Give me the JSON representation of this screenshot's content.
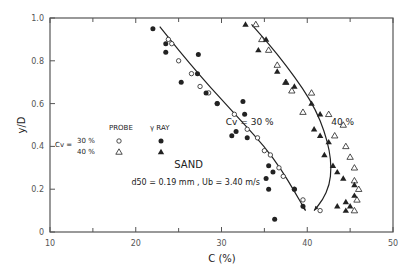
{
  "chart_data": {
    "type": "scatter",
    "title": "",
    "xlabel": "C (%)",
    "ylabel": "y/D",
    "xlim": [
      10,
      50
    ],
    "ylim": [
      0,
      1.0
    ],
    "xticks": [
      10,
      20,
      30,
      40,
      50
    ],
    "xminor": [
      15,
      25,
      35,
      45
    ],
    "yticks": [
      0,
      0.2,
      0.4,
      0.6,
      0.8,
      1.0
    ],
    "ytick_labels": [
      "0",
      "0.2",
      "0.4",
      "0.6",
      "0.8",
      "1.0"
    ],
    "grid": false,
    "legend": {
      "position": "left-middle",
      "header_probe": "PROBE",
      "header_ray": "γ RAY",
      "row_label": "Cv =",
      "rows": [
        {
          "label": "30 %",
          "probe_marker": "open-circle",
          "ray_marker": "filled-circle"
        },
        {
          "label": "40 %",
          "probe_marker": "open-triangle",
          "ray_marker": "filled-triangle"
        }
      ]
    },
    "annotations": [
      {
        "text": "Cv =  30 %",
        "x": 30.5,
        "y": 0.5
      },
      {
        "text": "40 %",
        "x": 42.8,
        "y": 0.5
      },
      {
        "text": "SAND",
        "x": 24.5,
        "y": 0.3
      },
      {
        "text": "d50 = 0.19 mm ,  Ub = 3.40 m/s",
        "x": 19.5,
        "y": 0.22
      }
    ],
    "series": [
      {
        "name": "Cv 30% PROBE",
        "marker": "open-circle",
        "points": [
          [
            23.8,
            0.9
          ],
          [
            24.2,
            0.88
          ],
          [
            25.0,
            0.8
          ],
          [
            26.5,
            0.74
          ],
          [
            27.5,
            0.68
          ],
          [
            28.5,
            0.65
          ],
          [
            29.5,
            0.6
          ],
          [
            31.5,
            0.55
          ],
          [
            33.0,
            0.48
          ],
          [
            34.2,
            0.44
          ],
          [
            35.0,
            0.38
          ],
          [
            35.7,
            0.36
          ],
          [
            36.7,
            0.3
          ],
          [
            37.2,
            0.26
          ],
          [
            38.5,
            0.2
          ],
          [
            39.5,
            0.15
          ],
          [
            41.5,
            0.1
          ]
        ]
      },
      {
        "name": "Cv 30% GAMMA RAY",
        "marker": "filled-circle",
        "points": [
          [
            22.0,
            0.95
          ],
          [
            23.5,
            0.88
          ],
          [
            23.5,
            0.84
          ],
          [
            27.3,
            0.83
          ],
          [
            25.3,
            0.7
          ],
          [
            27.2,
            0.74
          ],
          [
            28.2,
            0.65
          ],
          [
            29.5,
            0.6
          ],
          [
            32.5,
            0.61
          ],
          [
            32.7,
            0.55
          ],
          [
            31.7,
            0.47
          ],
          [
            31.2,
            0.45
          ],
          [
            33.0,
            0.44
          ],
          [
            35.5,
            0.31
          ],
          [
            36.0,
            0.28
          ],
          [
            35.2,
            0.25
          ],
          [
            35.5,
            0.2
          ],
          [
            38.5,
            0.2
          ],
          [
            39.5,
            0.12
          ],
          [
            36.2,
            0.06
          ]
        ]
      },
      {
        "name": "Cv 40% PROBE",
        "marker": "open-triangle",
        "points": [
          [
            34.0,
            0.97
          ],
          [
            34.7,
            0.9
          ],
          [
            35.5,
            0.85
          ],
          [
            36.5,
            0.78
          ],
          [
            37.5,
            0.7
          ],
          [
            38.2,
            0.66
          ],
          [
            40.5,
            0.65
          ],
          [
            39.5,
            0.56
          ],
          [
            42.5,
            0.55
          ],
          [
            44.2,
            0.5
          ],
          [
            43.2,
            0.45
          ],
          [
            44.5,
            0.4
          ],
          [
            45.0,
            0.35
          ],
          [
            45.5,
            0.3
          ],
          [
            45.5,
            0.24
          ],
          [
            46.0,
            0.2
          ],
          [
            45.8,
            0.15
          ],
          [
            45.5,
            0.1
          ]
        ]
      },
      {
        "name": "Cv 40% GAMMA RAY",
        "marker": "filled-triangle",
        "points": [
          [
            32.8,
            0.97
          ],
          [
            35.2,
            0.9
          ],
          [
            34.3,
            0.85
          ],
          [
            36.5,
            0.75
          ],
          [
            37.5,
            0.7
          ],
          [
            38.5,
            0.68
          ],
          [
            40.5,
            0.6
          ],
          [
            41.5,
            0.55
          ],
          [
            40.8,
            0.48
          ],
          [
            41.5,
            0.45
          ],
          [
            42.5,
            0.42
          ],
          [
            42.0,
            0.36
          ],
          [
            43.0,
            0.31
          ],
          [
            43.5,
            0.28
          ],
          [
            44.2,
            0.25
          ],
          [
            45.5,
            0.22
          ],
          [
            45.5,
            0.17
          ],
          [
            44.5,
            0.14
          ],
          [
            43.5,
            0.12
          ],
          [
            45.0,
            0.12
          ],
          [
            44.5,
            0.1
          ]
        ]
      }
    ],
    "curves": [
      {
        "name": "Cv 30% fit",
        "points": [
          [
            22.8,
            0.96
          ],
          [
            25,
            0.85
          ],
          [
            27.5,
            0.73
          ],
          [
            30,
            0.62
          ],
          [
            32.5,
            0.51
          ],
          [
            35,
            0.4
          ],
          [
            37,
            0.29
          ],
          [
            38.5,
            0.19
          ],
          [
            39.8,
            0.1
          ]
        ]
      },
      {
        "name": "Cv 40% fit",
        "points": [
          [
            33.5,
            0.97
          ],
          [
            35.5,
            0.88
          ],
          [
            37.5,
            0.78
          ],
          [
            39.5,
            0.67
          ],
          [
            41.0,
            0.57
          ],
          [
            42.0,
            0.47
          ],
          [
            42.6,
            0.38
          ],
          [
            42.8,
            0.3
          ],
          [
            42.6,
            0.22
          ],
          [
            41.8,
            0.15
          ],
          [
            40.8,
            0.1
          ]
        ]
      }
    ]
  },
  "colors": {
    "ink": "#222222",
    "axis": "#555555",
    "background": "#ffffff"
  }
}
